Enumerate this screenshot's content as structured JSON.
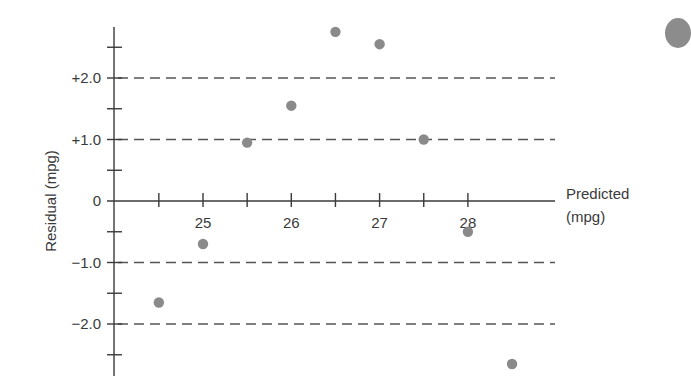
{
  "chart_data": {
    "type": "scatter",
    "title": "",
    "xlabel": "Predicted (mpg)",
    "xlabel_lines": [
      "Predicted",
      "(mpg)"
    ],
    "ylabel": "Residual (mpg)",
    "x_tick_labels": [
      "25",
      "26",
      "27",
      "28"
    ],
    "x_ticks": [
      24.5,
      25,
      25.5,
      26,
      26.5,
      27,
      27.5,
      28
    ],
    "y_tick_labels": [
      "+2.0",
      "+1.0",
      "0",
      "−1.0",
      "−2.0"
    ],
    "y_ticks_major": [
      2.0,
      1.0,
      0,
      -1.0,
      -2.0
    ],
    "y_ticks_minor": [
      2.5,
      1.5,
      0.5,
      -0.5,
      -1.5,
      -2.5
    ],
    "dashed_reference_lines": [
      2.0,
      1.0,
      -1.0,
      -2.0
    ],
    "xlim": [
      24.0,
      29.0
    ],
    "ylim": [
      -2.8,
      2.9
    ],
    "grid": false,
    "legend": null,
    "series": [
      {
        "name": "Residuals",
        "color": "#8a8a8a",
        "points": [
          {
            "x": 24.5,
            "y": -1.65
          },
          {
            "x": 25.0,
            "y": -0.7
          },
          {
            "x": 25.5,
            "y": 0.95
          },
          {
            "x": 26.0,
            "y": 1.55
          },
          {
            "x": 26.5,
            "y": 2.75
          },
          {
            "x": 27.0,
            "y": 2.55
          },
          {
            "x": 27.5,
            "y": 1.0
          },
          {
            "x": 28.0,
            "y": -0.5
          },
          {
            "x": 28.5,
            "y": -2.65
          }
        ]
      }
    ]
  },
  "colors": {
    "axis": "#3a3a3a",
    "dash": "#555555",
    "point": "#8a8a8a",
    "text": "#3a3a3a"
  }
}
